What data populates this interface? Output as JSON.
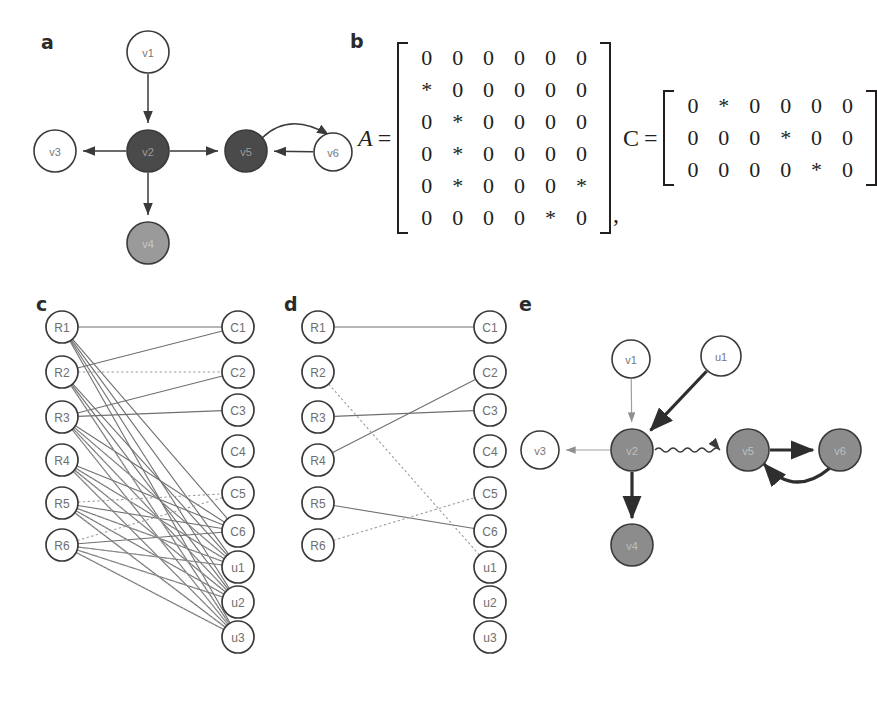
{
  "figure": {
    "panels": {
      "a": "a",
      "b": "b",
      "c": "c",
      "d": "d",
      "e": "e"
    }
  },
  "colors": {
    "ink": "#231f20",
    "node_white_fill": "#ffffff",
    "node_dark_fill": "#4a4a4a",
    "node_mid_fill": "#9a9a9a",
    "node_gray_fill": "#8c8c8c",
    "edge_gray": "#6f6f6f",
    "edge_light": "#9d9d9d",
    "stroke": "#3a3a3a"
  },
  "panel_a": {
    "label": "a",
    "nodes": [
      {
        "id": "v1",
        "label": "v1",
        "x": 148,
        "y": 52,
        "r": 21,
        "fill": "white"
      },
      {
        "id": "v2",
        "label": "v2",
        "x": 148,
        "y": 151,
        "r": 21,
        "fill": "dark"
      },
      {
        "id": "v3",
        "label": "v3",
        "x": 55,
        "y": 151,
        "r": 21,
        "fill": "white"
      },
      {
        "id": "v4",
        "label": "v4",
        "x": 148,
        "y": 243,
        "r": 21,
        "fill": "mid"
      },
      {
        "id": "v5",
        "label": "v5",
        "x": 246,
        "y": 151,
        "r": 21,
        "fill": "dark"
      },
      {
        "id": "v6",
        "label": "v6",
        "x": 333,
        "y": 152,
        "r": 19,
        "fill": "white"
      }
    ],
    "edges": [
      {
        "from": "v1",
        "to": "v2",
        "type": "straight"
      },
      {
        "from": "v2",
        "to": "v3",
        "type": "straight"
      },
      {
        "from": "v2",
        "to": "v4",
        "type": "straight"
      },
      {
        "from": "v2",
        "to": "v5",
        "type": "straight"
      },
      {
        "from": "v6",
        "to": "v5",
        "type": "straight"
      },
      {
        "from": "v5",
        "to": "v6",
        "type": "curved"
      }
    ]
  },
  "panel_b": {
    "label": "b",
    "matrix_A": {
      "name": "A",
      "equals": "=",
      "rows": [
        [
          "0",
          "0",
          "0",
          "0",
          "0",
          "0"
        ],
        [
          "*",
          "0",
          "0",
          "0",
          "0",
          "0"
        ],
        [
          "0",
          "*",
          "0",
          "0",
          "0",
          "0"
        ],
        [
          "0",
          "*",
          "0",
          "0",
          "0",
          "0"
        ],
        [
          "0",
          "*",
          "0",
          "0",
          "0",
          "*"
        ],
        [
          "0",
          "0",
          "0",
          "0",
          "*",
          "0"
        ]
      ]
    },
    "separator": ",",
    "matrix_C": {
      "name": "C",
      "equals": "=",
      "rows": [
        [
          "0",
          "*",
          "0",
          "0",
          "0",
          "0"
        ],
        [
          "0",
          "0",
          "0",
          "*",
          "0",
          "0"
        ],
        [
          "0",
          "0",
          "0",
          "0",
          "*",
          "0"
        ]
      ]
    }
  },
  "panel_c": {
    "label": "c",
    "left_nodes": [
      {
        "id": "R1",
        "label": "R1",
        "x": 62,
        "y": 327
      },
      {
        "id": "R2",
        "label": "R2",
        "x": 62,
        "y": 372
      },
      {
        "id": "R3",
        "label": "R3",
        "x": 62,
        "y": 417
      },
      {
        "id": "R4",
        "label": "R4",
        "x": 62,
        "y": 460
      },
      {
        "id": "R5",
        "label": "R5",
        "x": 62,
        "y": 503
      },
      {
        "id": "R6",
        "label": "R6",
        "x": 62,
        "y": 545
      }
    ],
    "right_nodes": [
      {
        "id": "C1",
        "label": "C1",
        "x": 238,
        "y": 327
      },
      {
        "id": "C2",
        "label": "C2",
        "x": 238,
        "y": 372
      },
      {
        "id": "C3",
        "label": "C3",
        "x": 238,
        "y": 410
      },
      {
        "id": "C4",
        "label": "C4",
        "x": 238,
        "y": 451
      },
      {
        "id": "C5",
        "label": "C5",
        "x": 238,
        "y": 493
      },
      {
        "id": "C6",
        "label": "C6",
        "x": 238,
        "y": 531
      },
      {
        "id": "u1",
        "label": "u1",
        "x": 238,
        "y": 567
      },
      {
        "id": "u2",
        "label": "u2",
        "x": 238,
        "y": 602
      },
      {
        "id": "u3",
        "label": "u3",
        "x": 238,
        "y": 637
      }
    ],
    "solid_edges": [
      [
        "R1",
        "C1"
      ],
      [
        "R1",
        "u1"
      ],
      [
        "R1",
        "u2"
      ],
      [
        "R1",
        "u3"
      ],
      [
        "R1",
        "C6"
      ],
      [
        "R2",
        "C1"
      ],
      [
        "R2",
        "u1"
      ],
      [
        "R2",
        "u2"
      ],
      [
        "R2",
        "u3"
      ],
      [
        "R3",
        "C3"
      ],
      [
        "R3",
        "C2"
      ],
      [
        "R3",
        "u1"
      ],
      [
        "R3",
        "u2"
      ],
      [
        "R3",
        "u3"
      ],
      [
        "R3",
        "C6"
      ],
      [
        "R4",
        "u1"
      ],
      [
        "R4",
        "u2"
      ],
      [
        "R4",
        "u3"
      ],
      [
        "R4",
        "C6"
      ],
      [
        "R5",
        "C6"
      ],
      [
        "R5",
        "u1"
      ],
      [
        "R5",
        "u2"
      ],
      [
        "R5",
        "u3"
      ],
      [
        "R6",
        "C6"
      ],
      [
        "R6",
        "u1"
      ],
      [
        "R6",
        "u2"
      ],
      [
        "R6",
        "u3"
      ]
    ],
    "dashed_edges": [
      [
        "R2",
        "C2"
      ],
      [
        "R2",
        "u3"
      ],
      [
        "R3",
        "u1"
      ],
      [
        "R3",
        "u2"
      ],
      [
        "R3",
        "u3"
      ],
      [
        "R4",
        "u1"
      ],
      [
        "R4",
        "u2"
      ],
      [
        "R4",
        "u3"
      ],
      [
        "R5",
        "C5"
      ],
      [
        "R5",
        "u1"
      ],
      [
        "R5",
        "u2"
      ],
      [
        "R5",
        "u3"
      ],
      [
        "R6",
        "C5"
      ],
      [
        "R6",
        "u1"
      ],
      [
        "R6",
        "u2"
      ],
      [
        "R6",
        "u3"
      ]
    ]
  },
  "panel_d": {
    "label": "d",
    "left_nodes": [
      {
        "id": "R1",
        "label": "R1",
        "x": 318,
        "y": 327
      },
      {
        "id": "R2",
        "label": "R2",
        "x": 318,
        "y": 372
      },
      {
        "id": "R3",
        "label": "R3",
        "x": 318,
        "y": 417
      },
      {
        "id": "R4",
        "label": "R4",
        "x": 318,
        "y": 460
      },
      {
        "id": "R5",
        "label": "R5",
        "x": 318,
        "y": 503
      },
      {
        "id": "R6",
        "label": "R6",
        "x": 318,
        "y": 545
      }
    ],
    "right_nodes": [
      {
        "id": "C1",
        "label": "C1",
        "x": 490,
        "y": 327
      },
      {
        "id": "C2",
        "label": "C2",
        "x": 490,
        "y": 372
      },
      {
        "id": "C3",
        "label": "C3",
        "x": 490,
        "y": 410
      },
      {
        "id": "C4",
        "label": "C4",
        "x": 490,
        "y": 451
      },
      {
        "id": "C5",
        "label": "C5",
        "x": 490,
        "y": 493
      },
      {
        "id": "C6",
        "label": "C6",
        "x": 490,
        "y": 531
      },
      {
        "id": "u1",
        "label": "u1",
        "x": 490,
        "y": 567
      },
      {
        "id": "u2",
        "label": "u2",
        "x": 490,
        "y": 602
      },
      {
        "id": "u3",
        "label": "u3",
        "x": 490,
        "y": 637
      }
    ],
    "solid_edges": [
      [
        "R1",
        "C1"
      ],
      [
        "R3",
        "C3"
      ],
      [
        "R4",
        "C2"
      ],
      [
        "R5",
        "C6"
      ]
    ],
    "dashed_edges": [
      [
        "R2",
        "u1"
      ],
      [
        "R6",
        "C5"
      ]
    ]
  },
  "panel_e": {
    "label": "e",
    "nodes": [
      {
        "id": "v1",
        "label": "v1",
        "x": 631,
        "y": 359,
        "r": 19,
        "fill": "white"
      },
      {
        "id": "u1",
        "label": "u1",
        "x": 721,
        "y": 356,
        "r": 20,
        "fill": "white"
      },
      {
        "id": "v2",
        "label": "v2",
        "x": 632,
        "y": 450,
        "r": 21,
        "fill": "gray"
      },
      {
        "id": "v3",
        "label": "v3",
        "x": 540,
        "y": 450,
        "r": 19,
        "fill": "white"
      },
      {
        "id": "v4",
        "label": "v4",
        "x": 632,
        "y": 545,
        "r": 21,
        "fill": "gray"
      },
      {
        "id": "v5",
        "label": "v5",
        "x": 748,
        "y": 450,
        "r": 21,
        "fill": "gray"
      },
      {
        "id": "v6",
        "label": "v6",
        "x": 840,
        "y": 450,
        "r": 21,
        "fill": "gray"
      }
    ],
    "edges": [
      {
        "from": "v1",
        "to": "v2",
        "type": "thin-gray"
      },
      {
        "from": "u1",
        "to": "v2",
        "type": "thick"
      },
      {
        "from": "v2",
        "to": "v3",
        "type": "thin-gray"
      },
      {
        "from": "v2",
        "to": "v4",
        "type": "thick"
      },
      {
        "from": "v2",
        "to": "v5",
        "type": "wavy"
      },
      {
        "from": "v5",
        "to": "v6",
        "type": "thick"
      },
      {
        "from": "v6",
        "to": "v5",
        "type": "thick-curved"
      }
    ]
  }
}
